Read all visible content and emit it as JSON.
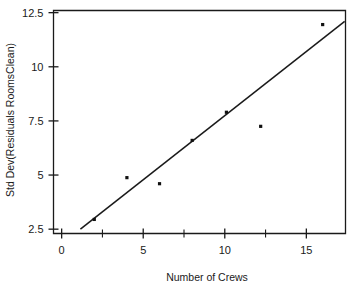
{
  "chart_data": {
    "type": "scatter",
    "title": "",
    "xlabel": "Number of Crews",
    "ylabel": "Std Dev(Residuals RoomsClean)",
    "xlim": [
      -0.5,
      17.4
    ],
    "ylim": [
      2.3,
      12.6
    ],
    "xticks": [
      0,
      5,
      10,
      15
    ],
    "xtick_labels": [
      "0",
      "5",
      "10",
      "15"
    ],
    "xticks_minor": [
      2.5,
      7.5,
      12.5,
      17.5
    ],
    "yticks": [
      2.5,
      5,
      7.5,
      10,
      12.5
    ],
    "ytick_labels": [
      "2.5",
      "5",
      "7.5",
      "10",
      "12.5"
    ],
    "grid": false,
    "legend": "none",
    "marker": "square",
    "marker_color": "#111111",
    "line_color": "#1a1a1a",
    "points": [
      {
        "x": 2.0,
        "y": 2.95
      },
      {
        "x": 4.0,
        "y": 4.88
      },
      {
        "x": 6.0,
        "y": 4.6
      },
      {
        "x": 8.0,
        "y": 6.6
      },
      {
        "x": 10.1,
        "y": 7.9
      },
      {
        "x": 12.2,
        "y": 7.25
      },
      {
        "x": 16.0,
        "y": 11.95
      }
    ],
    "fit_line": {
      "name": "linear fit",
      "x_start": 1.15,
      "y_start": 2.5,
      "x_end": 17.35,
      "y_end": 12.1
    }
  },
  "axes": {
    "y_title": "Std Dev(Residuals RoomsClean)",
    "x_title": "Number of Crews"
  },
  "figure": {
    "cropped_title": "",
    "background_color": "#ffffff",
    "ink_color": "#1a1a1a"
  }
}
